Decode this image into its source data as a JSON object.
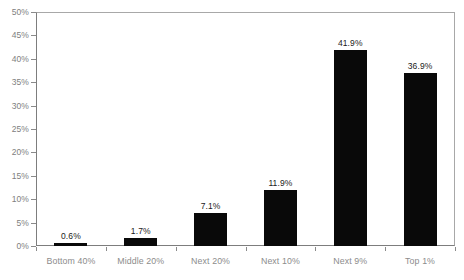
{
  "chart_data": {
    "type": "bar",
    "title": "",
    "subtitle": "",
    "xlabel": "",
    "ylabel": "",
    "categories": [
      "Bottom 40%",
      "Middle 20%",
      "Next 20%",
      "Next 10%",
      "Next 9%",
      "Top 1%"
    ],
    "values": [
      0.6,
      1.7,
      7.1,
      11.9,
      41.9,
      36.9
    ],
    "data_labels": [
      "0.6%",
      "1.7%",
      "7.1%",
      "11.9%",
      "41.9%",
      "36.9%"
    ],
    "ylim": [
      0,
      50
    ],
    "y_tick_values": [
      0,
      5,
      10,
      15,
      20,
      25,
      30,
      35,
      40,
      45,
      50
    ],
    "y_tick_labels": [
      "0%",
      "5%",
      "10%",
      "15%",
      "20%",
      "25%",
      "30%",
      "35%",
      "40%",
      "45%",
      "50%"
    ],
    "grid": false,
    "legend": false,
    "legend_position": "none",
    "colors": {
      "bar": "#090909",
      "axis_line": "#7d7d7d",
      "plot_border": "#a8a8a8",
      "tick_label": "#808080",
      "category_label": "#8c8c8c",
      "value_label": "#1a1a1a",
      "background": "#ffffff"
    }
  }
}
